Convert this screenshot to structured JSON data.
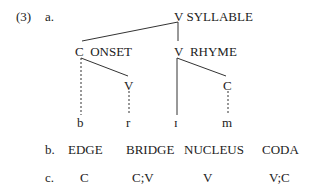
{
  "example_number": "(3)",
  "part_a": {
    "label": "a.",
    "nodes": {
      "syllable_cat": "V",
      "syllable_label": "SYLLABLE",
      "onset_cat": "C",
      "onset_label": "ONSET",
      "rhyme_cat": "V",
      "rhyme_label": "RHYME",
      "onset_sub": "V",
      "rhyme_sub": "C"
    },
    "segments": [
      "b",
      "r",
      "ɪ",
      "m"
    ]
  },
  "part_b": {
    "label": "b.",
    "items": [
      "EDGE",
      "BRIDGE",
      "NUCLEUS",
      "CODA"
    ]
  },
  "part_c": {
    "label": "c.",
    "items": [
      "C",
      "C;V",
      "V",
      "V;C"
    ]
  }
}
